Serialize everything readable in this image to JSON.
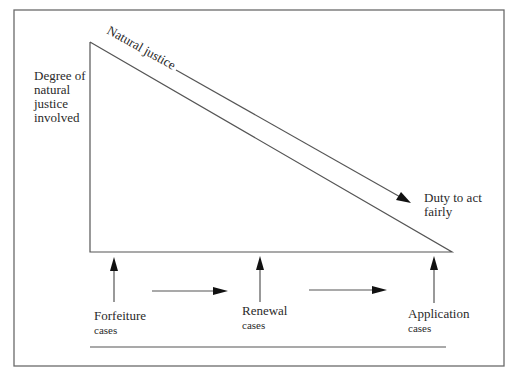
{
  "diagram": {
    "y_axis_label": [
      "Degree of",
      "natural",
      "justice",
      "involved"
    ],
    "slope_top_label": "Natural justice",
    "slope_bottom_label": [
      "Duty to act",
      "fairly"
    ],
    "case_types": [
      {
        "name": "Forfeiture",
        "sub": "cases"
      },
      {
        "name": "Renewal",
        "sub": "cases"
      },
      {
        "name": "Application",
        "sub": "cases"
      }
    ],
    "colors": {
      "line": "#555555",
      "frame": "#6a6a6a",
      "arrowhead": "#111111",
      "text": "#2a2a2a"
    }
  }
}
